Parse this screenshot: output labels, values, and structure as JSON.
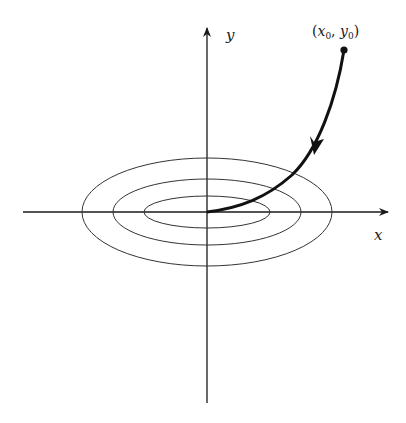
{
  "diagram": {
    "title": "",
    "axes": {
      "x_label": "x",
      "y_label": "y"
    },
    "start_point_label": "(x₀, y₀)",
    "start_point_label_parts": {
      "open": "(",
      "x": "x",
      "x_sub": "0",
      "sep": ", ",
      "y": "y",
      "y_sub": "0",
      "close": ")"
    },
    "ellipses": [
      {
        "name": "inner",
        "rx": 63,
        "ry": 16
      },
      {
        "name": "middle",
        "rx": 94,
        "ry": 33
      },
      {
        "name": "outer",
        "rx": 125,
        "ry": 54
      }
    ],
    "trajectory": {
      "description": "Trajectory from (x0, y0) spiraling toward origin along direction arrow",
      "direction": "toward origin"
    },
    "colors": {
      "line": "#1a1a1a",
      "ellipse": "#333333",
      "background": "#ffffff"
    }
  }
}
